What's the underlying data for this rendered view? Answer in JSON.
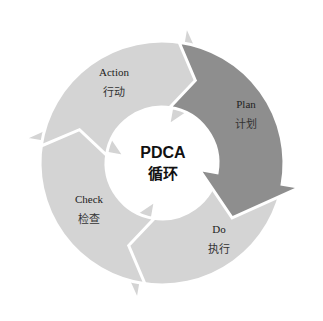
{
  "diagram": {
    "type": "cycle",
    "center": {
      "title": "PDCA",
      "subtitle": "循环"
    },
    "colors": {
      "dark": "#8e8e8e",
      "light": "#d4d4d4",
      "background": "#ffffff",
      "text": "#222222"
    },
    "steps": [
      {
        "id": "plan",
        "label_en": "Plan",
        "label_cn": "计划",
        "emphasis": "dark"
      },
      {
        "id": "do",
        "label_en": "Do",
        "label_cn": "执行",
        "emphasis": "light"
      },
      {
        "id": "check",
        "label_en": "Check",
        "label_cn": "检查",
        "emphasis": "light"
      },
      {
        "id": "action",
        "label_en": "Action",
        "label_cn": "行动",
        "emphasis": "light"
      }
    ]
  }
}
